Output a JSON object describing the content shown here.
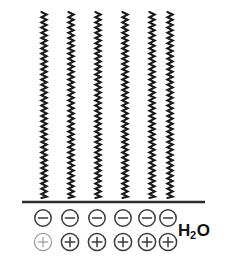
{
  "figure": {
    "width": 232,
    "height": 271,
    "background_color": "#ffffff"
  },
  "labels": {
    "water_formula_prefix": "H",
    "water_formula_subscript": "2",
    "water_formula_suffix": "O",
    "water_full": "H2O"
  },
  "colors": {
    "chain_stroke": "#1a1a1a",
    "substrate_stroke": "#2b2b2b",
    "ion_stroke": "#3a3a3a",
    "ion_faint_stroke": "#9a9a9a",
    "label_color": "#111111"
  },
  "chains": {
    "count": 6,
    "top_y": 12,
    "bottom_y": 198,
    "amplitude": 2.6,
    "period": 5.2,
    "stroke_width": 2.1,
    "x_centers": [
      44,
      71,
      98,
      125,
      152,
      170
    ]
  },
  "substrate": {
    "x_start": 22,
    "x_end": 205,
    "y": 202,
    "stroke_width": 2.6
  },
  "negative_ions": {
    "count": 6,
    "symbol": "minus",
    "row_y": 218,
    "radius": 8.2,
    "x_centers": [
      43,
      70,
      97,
      123,
      147,
      168
    ]
  },
  "positive_ions": {
    "count": 6,
    "symbol": "plus",
    "row_y": 242,
    "radius": 8.6,
    "x_centers": [
      43,
      70,
      97,
      123,
      147,
      168
    ]
  },
  "water_label_position": {
    "left": 178,
    "top": 222
  }
}
